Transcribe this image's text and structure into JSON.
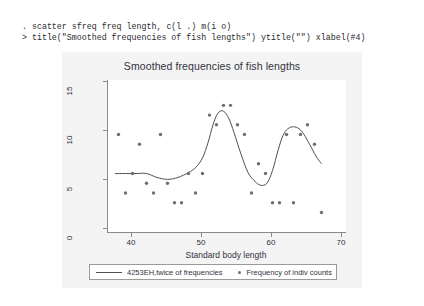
{
  "console": {
    "line1": ". scatter sfreq freq length, c(l .) m(i o)",
    "line2": "> title(\"Smoothed frequencies of fish lengths\") ytitle(\"\") xlabel(#4)"
  },
  "graph": {
    "title": "Smoothed frequencies of fish lengths",
    "xaxis_title": "Standard body length",
    "yaxis_title": "",
    "legend": {
      "line_label": "4253EH,twice of frequencies",
      "marker_label": "Frequency of indiv counts"
    }
  },
  "chart_data": {
    "type": "scatter",
    "title": "Smoothed frequencies of fish lengths",
    "xlabel": "Standard body length",
    "ylabel": "",
    "xlim": [
      36.5,
      70.5
    ],
    "ylim": [
      0,
      15.6
    ],
    "xticks": [
      40,
      50,
      60,
      70
    ],
    "yticks": [
      0,
      5,
      10,
      15
    ],
    "grid": false,
    "legend_position": "bottom",
    "series": [
      {
        "name": "Frequency of indiv counts",
        "type": "scatter",
        "marker": "circle",
        "color": "#6e6e78",
        "x": [
          38.0,
          39.0,
          40.0,
          41.0,
          42.0,
          43.0,
          44.0,
          45.0,
          46.0,
          47.0,
          48.0,
          49.0,
          50.0,
          51.0,
          52.0,
          53.0,
          54.0,
          55.0,
          56.0,
          57.0,
          58.0,
          59.0,
          60.0,
          61.0,
          62.0,
          63.0,
          64.0,
          65.0,
          66.0,
          67.0
        ],
        "y": [
          10.0,
          4.0,
          6.0,
          9.0,
          5.0,
          4.0,
          10.0,
          5.0,
          3.0,
          3.0,
          6.0,
          4.0,
          6.0,
          12.0,
          11.0,
          13.0,
          13.0,
          11.0,
          10.0,
          4.0,
          7.0,
          6.0,
          3.0,
          3.0,
          10.0,
          3.0,
          10.0,
          11.0,
          9.0,
          2.0
        ]
      },
      {
        "name": "4253EH,twice of frequencies",
        "type": "line",
        "color": "#4f4f58",
        "x": [
          37.5,
          39.0,
          40.5,
          42.0,
          43.5,
          45.0,
          46.5,
          48.0,
          49.0,
          50.0,
          50.8,
          51.5,
          52.2,
          53.0,
          53.8,
          54.5,
          55.5,
          56.5,
          57.5,
          58.3,
          59.2,
          60.0,
          60.8,
          61.5,
          62.2,
          63.0,
          63.8,
          64.5,
          65.3,
          66.2,
          67.0
        ],
        "y": [
          6.0,
          6.0,
          6.0,
          6.0,
          5.6,
          5.4,
          5.6,
          6.1,
          6.6,
          7.6,
          9.2,
          11.0,
          12.2,
          12.4,
          11.6,
          10.2,
          8.0,
          6.1,
          5.2,
          4.8,
          5.0,
          6.3,
          8.4,
          9.9,
          10.6,
          10.8,
          10.6,
          10.0,
          9.0,
          7.8,
          7.0
        ]
      }
    ]
  }
}
